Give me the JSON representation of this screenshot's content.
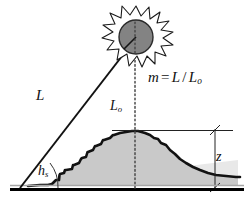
{
  "figure": {
    "background_color": "#ffffff"
  },
  "labels": {
    "slant_path": "L",
    "vertical_path_base": "L",
    "vertical_path_sub": "o",
    "solar_elevation_base": "h",
    "solar_elevation_sub": "s",
    "height": "z",
    "equation": {
      "lhs": "m",
      "operator": "=",
      "numerator": "L",
      "divider": "/",
      "denominator_base": "L",
      "denominator_sub": "o"
    }
  },
  "colors": {
    "ink": "#111111",
    "sun_disk": "#808080",
    "sun_disk_outline": "#222222",
    "corona_fill": "#ffffff",
    "layer_fill": "#c8c8c8",
    "haze_fill": "#e3e3e3",
    "ground": "#000000",
    "ground_shadow": "#9a9a9a",
    "dotted_line": "#555555"
  },
  "geometry": {
    "sun_center": [
      136,
      38
    ],
    "sun_radius": 17,
    "ray_origin": [
      20,
      188
    ],
    "peak": [
      135,
      131
    ],
    "ground_y": 188,
    "zenith_line_x": 135,
    "dimension_line_x": 215,
    "solar_elevation_arc_radius": 38
  },
  "icons": {
    "sun": "sun-icon",
    "terrain": "terrain-profile-icon"
  }
}
